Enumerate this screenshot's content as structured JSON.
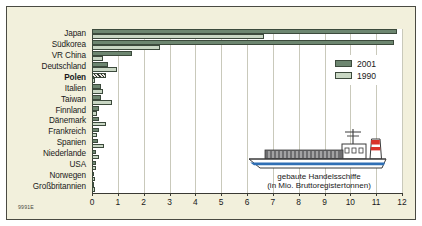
{
  "chart_data": {
    "type": "bar",
    "orientation": "horizontal",
    "title": "",
    "caption_line1": "gebaute Handelsschiffe",
    "caption_line2": "(in Mio. Bruttoregistertonnen)",
    "xlabel": "",
    "ylabel": "",
    "xlim": [
      0,
      12
    ],
    "xticks": [
      0,
      1,
      2,
      3,
      4,
      5,
      6,
      7,
      8,
      9,
      10,
      11,
      12
    ],
    "xticklabels": [
      "0",
      "1",
      "2",
      "3",
      "4",
      "5",
      "6",
      "7",
      "8",
      "9",
      "10",
      "11",
      "12"
    ],
    "grid": true,
    "legend_position": "upper-right",
    "categories": [
      "Japan",
      "Südkorea",
      "VR China",
      "Deutschland",
      "Polen",
      "Italien",
      "Taiwan",
      "Finnland",
      "Dänemark",
      "Frankreich",
      "Spanien",
      "Niederlande",
      "USA",
      "Norwegen",
      "Großbritannien"
    ],
    "highlighted_category": "Polen",
    "series": [
      {
        "name": "2001",
        "color": "#6d8670",
        "values": [
          11.8,
          11.7,
          1.55,
          0.62,
          0.53,
          0.36,
          0.33,
          0.29,
          0.27,
          0.26,
          0.25,
          0.17,
          0.14,
          0.07,
          0.05
        ]
      },
      {
        "name": "1990",
        "color": "#c9d7c4",
        "values": [
          6.66,
          2.62,
          0.44,
          0.97,
          0.12,
          0.42,
          0.78,
          0.21,
          0.55,
          0.2,
          0.45,
          0.27,
          0.14,
          0.11,
          0.13
        ]
      }
    ]
  },
  "legend": {
    "items": [
      {
        "label": "2001",
        "swatch": "dark-green"
      },
      {
        "label": "1990",
        "swatch": "light-green"
      }
    ]
  },
  "source_code": "9991E",
  "illustration": {
    "name": "cargo-ship",
    "hull_color": "#ffffff",
    "stripe_color": "#2f6fb5",
    "deck_color": "#58585a",
    "funnel_red": "#d9342b",
    "bridge_color": "#ffffff",
    "bridge_windows": "0 0 0"
  }
}
